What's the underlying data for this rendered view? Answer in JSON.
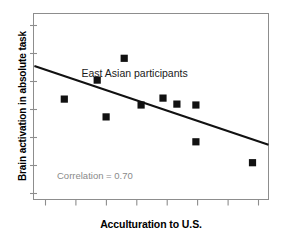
{
  "chart_data": {
    "type": "scatter",
    "title": "",
    "xlabel": "Acculturation to U.S.",
    "ylabel": "Brain activation in absolute task",
    "xlim": [
      0,
      10
    ],
    "ylim": [
      0,
      10
    ],
    "grid": false,
    "legend": "none",
    "series": [
      {
        "name": "East Asian participants",
        "marker": "filled-square",
        "color": "#111111",
        "points": [
          {
            "x": 1.31,
            "y": 5.4
          },
          {
            "x": 2.71,
            "y": 6.42
          },
          {
            "x": 3.86,
            "y": 7.59
          },
          {
            "x": 3.09,
            "y": 4.44
          },
          {
            "x": 4.58,
            "y": 5.08
          },
          {
            "x": 5.51,
            "y": 5.45
          },
          {
            "x": 6.1,
            "y": 5.13
          },
          {
            "x": 6.91,
            "y": 5.08
          },
          {
            "x": 6.91,
            "y": 3.1
          },
          {
            "x": 9.32,
            "y": 1.98
          }
        ]
      }
    ],
    "trendline": {
      "name": "regression-line",
      "color": "#111111",
      "x0": 0.04,
      "y0": 7.17,
      "x1": 10.0,
      "y1": 2.94,
      "slope_sign": "negative"
    },
    "annotations": [
      {
        "name": "series-label",
        "text": "East Asian participants",
        "x": 4.3,
        "y": 6.6,
        "color": "#1a1a1a"
      },
      {
        "name": "correlation-label",
        "text": "Correlation = 0.70",
        "x": 1.0,
        "y": 1.1,
        "color": "#8a8a8a"
      }
    ],
    "axes": {
      "x_tick_count": 8,
      "y_tick_count": 7,
      "x_tick_labels": [],
      "y_tick_labels": [],
      "frame_color": "#8d8d8d"
    }
  },
  "labels": {
    "y_axis_title": "Brain activation in absolute task",
    "x_axis_title": "Acculturation to U.S.",
    "series_annotation": "East Asian participants",
    "correlation_annotation": "Correlation = 0.70"
  }
}
